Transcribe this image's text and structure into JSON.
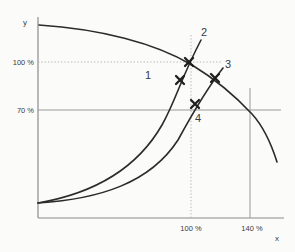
{
  "meta": {
    "width": 295,
    "height": 252
  },
  "colors": {
    "bg": "#fbfbfa",
    "curve": "#2b2b2b",
    "axis": "#8c8c8c",
    "ref": "#9a9a9a",
    "dotted": "#b3b3b3",
    "marker": "#1e1e1e",
    "text": "#3a3a3a"
  },
  "labels": {
    "y_axis": "y",
    "x_axis": "x",
    "y_tick_100": "100 %",
    "y_tick_70": "70 %",
    "x_tick_100": "100 %",
    "x_tick_140": "140 %",
    "point_1": "1",
    "point_2": "2",
    "point_3": "3",
    "point_4": "4"
  },
  "geo": {
    "y_axis": {
      "x1": 38,
      "y1": 17,
      "x2": 38,
      "y2": 218
    },
    "x_axis": {
      "x1": 38,
      "y1": 218,
      "x2": 284,
      "y2": 218
    },
    "ref_70": {
      "x1": 38,
      "y1": 110,
      "x2": 281,
      "y2": 110
    },
    "ref_140": {
      "x1": 250,
      "y1": 88,
      "x2": 250,
      "y2": 218
    },
    "dot_100_h": {
      "x1": 38,
      "y1": 62,
      "x2": 222,
      "y2": 62
    },
    "dot_100_v": {
      "x1": 191,
      "y1": 35,
      "x2": 191,
      "y2": 218
    },
    "falling_curve_d": "M 39 25 C 100 29 155 43 192 65 C 220 82 238 99 252 114 C 262 125 271 143 277 162",
    "rising_curve_steep_d": "M 38 203 C 90 194 135 172 162 125 C 176 100 181 78 201 40",
    "rising_curve_flat_d": "M 38 203 C 100 199 150 183 178 140 C 190 118 205 91 223 68",
    "text_pos": {
      "y_axis": {
        "x": 23,
        "y": 25
      },
      "x_axis": {
        "x": 277,
        "y": 241
      },
      "y_tick_100": {
        "x": 34,
        "y": 65
      },
      "y_tick_70": {
        "x": 34,
        "y": 113
      },
      "x_tick_100": {
        "x": 191,
        "y": 231
      },
      "x_tick_140": {
        "x": 252,
        "y": 231
      },
      "point_1": {
        "x": 148,
        "y": 79
      },
      "point_2": {
        "x": 204,
        "y": 36
      },
      "point_3": {
        "x": 228,
        "y": 68
      },
      "point_4": {
        "x": 198,
        "y": 122
      }
    }
  },
  "markers": [
    {
      "name": "marker-point-2",
      "cx": 189,
      "cy": 62,
      "size": 4
    },
    {
      "name": "marker-point-1",
      "cx": 180,
      "cy": 80,
      "size": 4
    },
    {
      "name": "marker-point-3",
      "cx": 215,
      "cy": 78,
      "size": 4
    },
    {
      "name": "marker-point-4",
      "cx": 195,
      "cy": 104,
      "size": 4
    }
  ],
  "chart_data": {
    "type": "line",
    "title": "",
    "xlabel": "x",
    "ylabel": "y",
    "x_ticks_pct": [
      100,
      140
    ],
    "y_ticks_pct": [
      70,
      100
    ],
    "grid": "reference lines only: dotted at x=100%/y=100%, solid at y=70% and x=140%",
    "legend_position": "none",
    "series": [
      {
        "name": "falling characteristic curve",
        "style": "solid black curve, concave down, from top of y-axis to lower right",
        "points_pct": [
          [
            0,
            121
          ],
          [
            50,
            114
          ],
          [
            100,
            100
          ],
          [
            120,
            87
          ],
          [
            140,
            66
          ],
          [
            156,
            35
          ]
        ]
      },
      {
        "name": "rising curve through points 1 and 2 (steep)",
        "style": "solid black curve from origin region, concave up",
        "points_pct": [
          [
            0,
            9
          ],
          [
            40,
            21
          ],
          [
            70,
            42
          ],
          [
            93,
            86
          ],
          [
            100,
            100
          ],
          [
            107,
            111
          ]
        ]
      },
      {
        "name": "rising curve through points 4 and 3 (flat)",
        "style": "solid black curve from origin region, concave up",
        "points_pct": [
          [
            0,
            9
          ],
          [
            45,
            19
          ],
          [
            75,
            36
          ],
          [
            103,
            71
          ],
          [
            116,
            88
          ],
          [
            121,
            94
          ]
        ]
      }
    ],
    "annotated_points": [
      {
        "label": "2",
        "x_pct": 100,
        "y_pct": 100,
        "marker": "bold x-cross at intersection of falling curve and steep rising curve"
      },
      {
        "label": "1",
        "x_pct": 93,
        "y_pct": 86,
        "marker": "bold x-cross on steep rising curve"
      },
      {
        "label": "3",
        "x_pct": 116,
        "y_pct": 88,
        "marker": "bold x-cross at intersection of falling curve and flat rising curve"
      },
      {
        "label": "4",
        "x_pct": 103,
        "y_pct": 71,
        "marker": "bold x-cross on flat rising curve"
      }
    ]
  }
}
